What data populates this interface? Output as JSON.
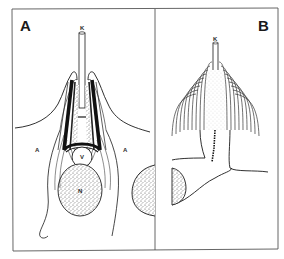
{
  "figure": {
    "panels": [
      {
        "id": "A",
        "letter": "A",
        "labels": {
          "top_rod": "K",
          "circle": "V",
          "oval": "N",
          "left_side": "A",
          "right_side": "A"
        }
      },
      {
        "id": "B",
        "letter": "B",
        "labels": {
          "top_rod": "K"
        }
      }
    ],
    "colors": {
      "line": "#1a1a1a",
      "frame": "#555555",
      "background": "#ffffff"
    }
  }
}
